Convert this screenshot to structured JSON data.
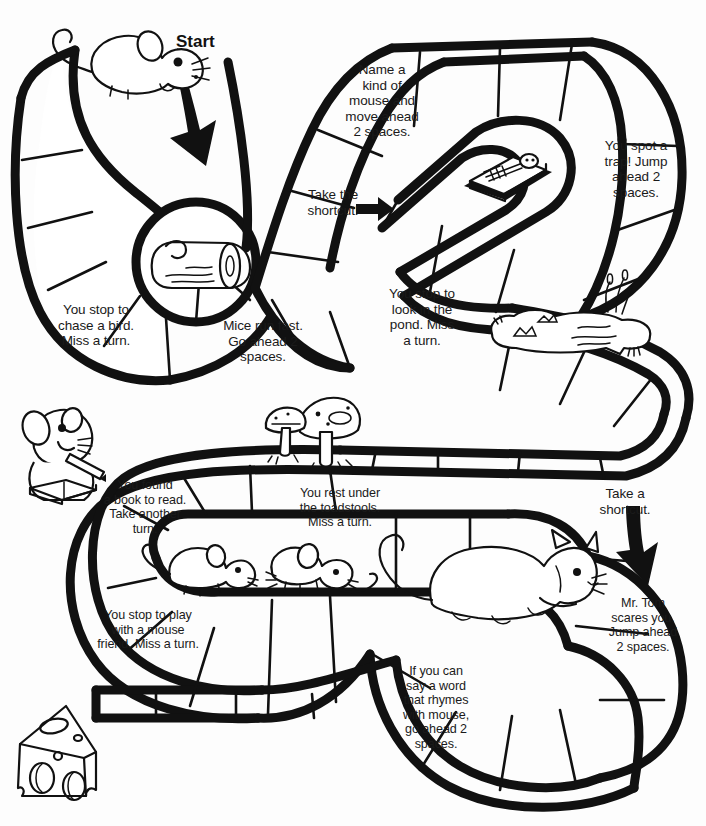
{
  "page": {
    "ink_color": "#111111",
    "paper_color": "#ffffff"
  },
  "labels": {
    "start": "Start"
  },
  "spaces": [
    {
      "id": "name-a-kind-of-mouse",
      "text": "Name a\nkind of\nmouse and\nmove ahead\n2 spaces."
    },
    {
      "id": "you-spot-a-trap",
      "text": "You spot a\ntrap!  Jump\nahead 2\nspaces."
    },
    {
      "id": "take-the-shortcut",
      "text": "Take the\nshortcut!"
    },
    {
      "id": "you-stop-to-chase-a-bird",
      "text": "You stop to\nchase a bird.\nMiss a turn."
    },
    {
      "id": "mice-run-fast",
      "text": "Mice run fast.\nGo ahead 2\nspaces."
    },
    {
      "id": "you-stop-to-look-in-the-pond",
      "text": "You stop to\nlook in the\npond.  Miss\na turn."
    },
    {
      "id": "you-found-a-book-to-read",
      "text": "You found\na book to read.\nTake another\nturn."
    },
    {
      "id": "you-rest-under-the-toadstools",
      "text": "You rest under\nthe toadstools.\nMiss a turn."
    },
    {
      "id": "take-a-shortcut",
      "text": "Take a\nshortcut."
    },
    {
      "id": "you-stop-to-play-with-a-mouse-friend",
      "text": "You stop to play\nwith a mouse\nfriend.  Miss a turn."
    },
    {
      "id": "mr-tom-scares-you",
      "text": "Mr. Tom\nscares you.\nJump ahead\n2 spaces."
    },
    {
      "id": "if-you-can-say-a-word-that-rhymes",
      "text": "If you can\nsay a word\nthat rhymes\nwith mouse,\ngo ahead 2\nspaces."
    }
  ],
  "illustrations": [
    {
      "id": "start-mouse",
      "name": "mouse-icon"
    },
    {
      "id": "start-arrow",
      "name": "down-arrow-icon"
    },
    {
      "id": "log",
      "name": "log-icon"
    },
    {
      "id": "mousetrap",
      "name": "mousetrap-icon"
    },
    {
      "id": "shortcut-arrow-top",
      "name": "right-arrow-icon"
    },
    {
      "id": "pond",
      "name": "pond-icon"
    },
    {
      "id": "reading-mouse",
      "name": "reading-mouse-icon"
    },
    {
      "id": "toadstools",
      "name": "toadstools-icon"
    },
    {
      "id": "two-mice",
      "name": "two-mice-icon"
    },
    {
      "id": "cat",
      "name": "cat-icon"
    },
    {
      "id": "shortcut-arrow-right",
      "name": "down-arrow-icon"
    },
    {
      "id": "cheese",
      "name": "cheese-icon"
    }
  ]
}
